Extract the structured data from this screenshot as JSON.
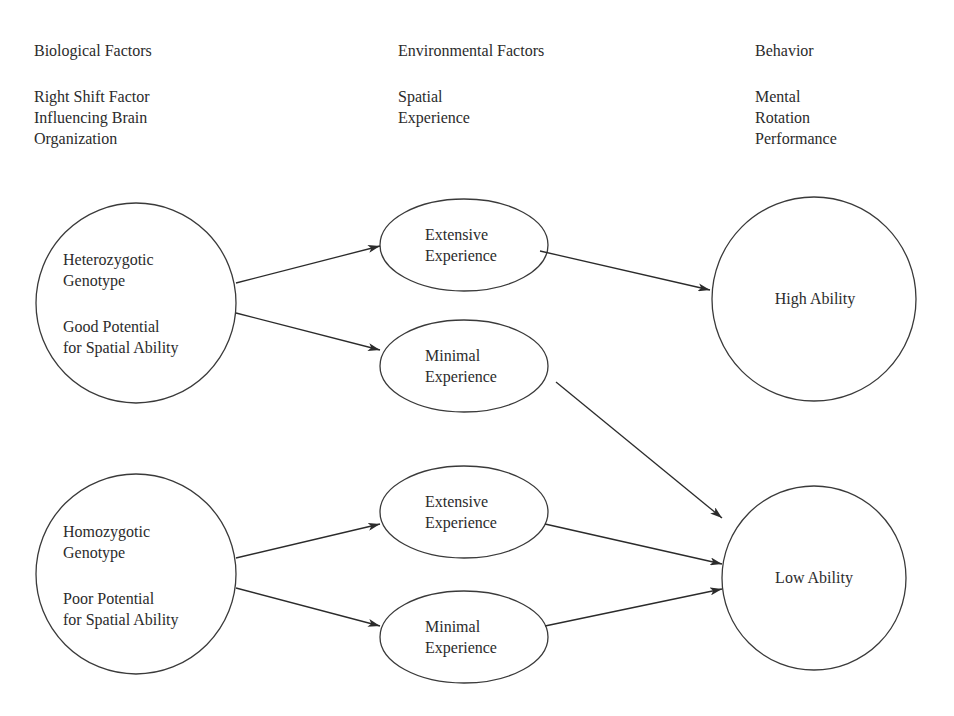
{
  "columns": [
    {
      "heading": "Biological Factors",
      "subheading": "Right Shift Factor\nInfluencing Brain\nOrganization"
    },
    {
      "heading": "Environmental Factors",
      "subheading": "Spatial\nExperience"
    },
    {
      "heading": "Behavior",
      "subheading": "Mental\nRotation\nPerformance"
    }
  ],
  "nodes": {
    "heterozygotic": {
      "title": "Heterozygotic\nGenotype",
      "detail": "Good Potential\nfor Spatial Ability"
    },
    "homozygotic": {
      "title": "Homozygotic\nGenotype",
      "detail": "Poor Potential\nfor Spatial Ability"
    },
    "extensive_1": {
      "label": "Extensive\nExperience"
    },
    "minimal_1": {
      "label": "Minimal\nExperience"
    },
    "extensive_2": {
      "label": "Extensive\nExperience"
    },
    "minimal_2": {
      "label": "Minimal\nExperience"
    },
    "high_ability": {
      "label": "High Ability"
    },
    "low_ability": {
      "label": "Low Ability"
    }
  },
  "edges": [
    {
      "from": "heterozygotic",
      "to": "extensive_1"
    },
    {
      "from": "heterozygotic",
      "to": "minimal_1"
    },
    {
      "from": "extensive_1",
      "to": "high_ability"
    },
    {
      "from": "minimal_1",
      "to": "low_ability"
    },
    {
      "from": "homozygotic",
      "to": "extensive_2"
    },
    {
      "from": "homozygotic",
      "to": "minimal_2"
    },
    {
      "from": "extensive_2",
      "to": "low_ability"
    },
    {
      "from": "minimal_2",
      "to": "low_ability"
    }
  ]
}
